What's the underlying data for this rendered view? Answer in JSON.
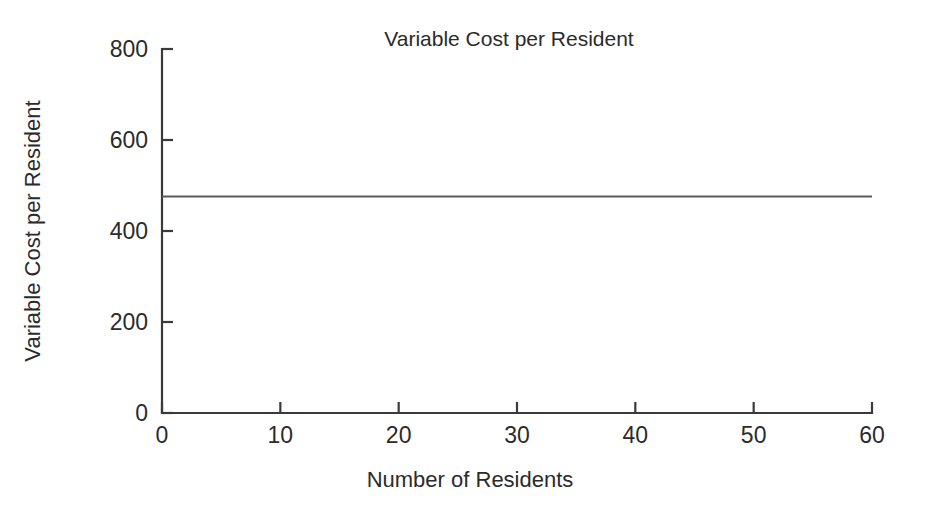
{
  "chart_data": {
    "type": "line",
    "title": "Variable Cost per Resident",
    "xlabel": "Number of Residents",
    "ylabel": "Variable Cost per Resident",
    "xlim": [
      0,
      60
    ],
    "ylim": [
      0,
      800
    ],
    "x_ticks": [
      0,
      10,
      20,
      30,
      40,
      50,
      60
    ],
    "x_tick_labels": [
      "0",
      "10",
      "20",
      "30",
      "40",
      "50",
      "60"
    ],
    "y_ticks": [
      0,
      200,
      400,
      600,
      800
    ],
    "y_tick_labels": [
      "0",
      "200",
      "400",
      "600",
      "800"
    ],
    "grid": false,
    "legend": false,
    "series": [
      {
        "name": "Variable Cost per Resident",
        "color": "#5a5a5a",
        "x": [
          0,
          10,
          20,
          30,
          40,
          50,
          60
        ],
        "values": [
          476,
          476,
          476,
          476,
          476,
          476,
          476
        ]
      }
    ],
    "annotations": []
  },
  "colors": {
    "background": "#ffffff",
    "axis": "#3a3a3a",
    "text": "#2b2b2b",
    "series": "#5a5a5a"
  }
}
